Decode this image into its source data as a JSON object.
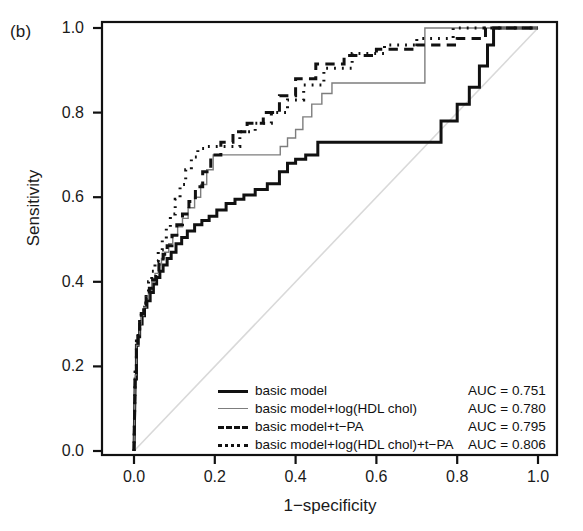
{
  "panel": {
    "label": "(b)"
  },
  "axes": {
    "xlabel": "1−specificity",
    "ylabel": "Sensitivity",
    "xticks": [
      "0.0",
      "0.2",
      "0.4",
      "0.6",
      "0.8",
      "1.0"
    ],
    "yticks": [
      "1.0",
      "0.8",
      "0.6",
      "0.4",
      "0.2",
      "0.0"
    ]
  },
  "legend": {
    "rows": [
      {
        "label": "basic model",
        "auc": "AUC = 0.751",
        "style": "solid-thick"
      },
      {
        "label": "basic model+log(HDL chol)",
        "auc": "AUC = 0.780",
        "style": "solid-thin"
      },
      {
        "label": "basic model+t−PA",
        "auc": "AUC = 0.795",
        "style": "dashed"
      },
      {
        "label": "basic model+log(HDL chol)+t−PA",
        "auc": "AUC = 0.806",
        "style": "dotted"
      }
    ]
  },
  "colors": {
    "basic_model": "#111111",
    "hdl_model": "#7d7d7d",
    "tpa_model": "#111111",
    "combined_model": "#111111",
    "diagonal": "#d9d9d9",
    "frame": "#111111",
    "background": "#ffffff"
  },
  "chart_data": {
    "type": "line",
    "title": "",
    "subtitle": "",
    "xlabel": "1−specificity",
    "ylabel": "Sensitivity",
    "xlim": [
      0.0,
      1.0
    ],
    "ylim": [
      0.0,
      1.0
    ],
    "grid": false,
    "legend_position": "bottom-right",
    "annotations": [
      {
        "text": "(b)",
        "position": "outside-top-left"
      },
      {
        "text": "AUC = 0.751",
        "series": "basic model"
      },
      {
        "text": "AUC = 0.780",
        "series": "basic model+log(HDL chol)"
      },
      {
        "text": "AUC = 0.795",
        "series": "basic model+t−PA"
      },
      {
        "text": "AUC = 0.806",
        "series": "basic model+log(HDL chol)+t−PA"
      }
    ],
    "reference_line": {
      "name": "chance diagonal",
      "x": [
        0.0,
        1.0
      ],
      "y": [
        0.0,
        1.0
      ],
      "style": "solid",
      "color": "#d9d9d9"
    },
    "series": [
      {
        "name": "basic model",
        "auc": 0.751,
        "style": "solid",
        "width": 3.0,
        "color": "#111111",
        "x": [
          0.0,
          0.003,
          0.006,
          0.006,
          0.01,
          0.01,
          0.014,
          0.014,
          0.02,
          0.02,
          0.026,
          0.026,
          0.032,
          0.032,
          0.04,
          0.04,
          0.048,
          0.048,
          0.056,
          0.056,
          0.064,
          0.064,
          0.072,
          0.072,
          0.082,
          0.082,
          0.092,
          0.092,
          0.104,
          0.104,
          0.118,
          0.118,
          0.132,
          0.132,
          0.15,
          0.15,
          0.168,
          0.168,
          0.186,
          0.186,
          0.205,
          0.205,
          0.228,
          0.228,
          0.25,
          0.25,
          0.272,
          0.272,
          0.3,
          0.3,
          0.33,
          0.33,
          0.36,
          0.36,
          0.38,
          0.38,
          0.4,
          0.4,
          0.425,
          0.425,
          0.455,
          0.455,
          0.52,
          0.52,
          0.6,
          0.6,
          0.68,
          0.68,
          0.76,
          0.76,
          0.8,
          0.8,
          0.83,
          0.83,
          0.855,
          0.855,
          0.875,
          0.875,
          0.89,
          0.89,
          1.0
        ],
        "y": [
          0.0,
          0.17,
          0.17,
          0.25,
          0.25,
          0.27,
          0.27,
          0.3,
          0.3,
          0.32,
          0.32,
          0.34,
          0.34,
          0.355,
          0.355,
          0.375,
          0.375,
          0.395,
          0.395,
          0.41,
          0.41,
          0.425,
          0.425,
          0.44,
          0.44,
          0.455,
          0.455,
          0.47,
          0.47,
          0.49,
          0.49,
          0.505,
          0.505,
          0.52,
          0.52,
          0.535,
          0.535,
          0.545,
          0.545,
          0.555,
          0.555,
          0.57,
          0.57,
          0.585,
          0.585,
          0.595,
          0.595,
          0.605,
          0.605,
          0.618,
          0.618,
          0.632,
          0.632,
          0.66,
          0.66,
          0.68,
          0.68,
          0.69,
          0.69,
          0.7,
          0.7,
          0.73,
          0.73,
          0.73,
          0.73,
          0.73,
          0.73,
          0.73,
          0.73,
          0.78,
          0.78,
          0.82,
          0.82,
          0.86,
          0.86,
          0.91,
          0.91,
          0.96,
          0.96,
          1.0,
          1.0
        ]
      },
      {
        "name": "basic model+log(HDL chol)",
        "auc": 0.78,
        "style": "solid",
        "width": 1.4,
        "color": "#7d7d7d",
        "x": [
          0.0,
          0.003,
          0.006,
          0.006,
          0.01,
          0.01,
          0.014,
          0.014,
          0.018,
          0.018,
          0.024,
          0.024,
          0.03,
          0.03,
          0.036,
          0.036,
          0.044,
          0.044,
          0.052,
          0.052,
          0.06,
          0.06,
          0.068,
          0.068,
          0.076,
          0.076,
          0.086,
          0.086,
          0.096,
          0.096,
          0.108,
          0.108,
          0.12,
          0.12,
          0.134,
          0.134,
          0.15,
          0.15,
          0.165,
          0.165,
          0.18,
          0.18,
          0.196,
          0.196,
          0.362,
          0.362,
          0.38,
          0.38,
          0.4,
          0.4,
          0.418,
          0.418,
          0.44,
          0.44,
          0.465,
          0.465,
          0.49,
          0.49,
          0.72,
          0.72,
          1.0
        ],
        "y": [
          0.0,
          0.18,
          0.18,
          0.25,
          0.25,
          0.275,
          0.275,
          0.3,
          0.3,
          0.32,
          0.32,
          0.34,
          0.34,
          0.36,
          0.36,
          0.38,
          0.38,
          0.4,
          0.4,
          0.42,
          0.42,
          0.44,
          0.44,
          0.455,
          0.455,
          0.47,
          0.47,
          0.49,
          0.49,
          0.51,
          0.51,
          0.53,
          0.53,
          0.55,
          0.55,
          0.575,
          0.575,
          0.6,
          0.6,
          0.63,
          0.63,
          0.665,
          0.665,
          0.7,
          0.7,
          0.72,
          0.72,
          0.74,
          0.74,
          0.76,
          0.76,
          0.79,
          0.79,
          0.82,
          0.82,
          0.845,
          0.845,
          0.87,
          0.87,
          1.0,
          1.0
        ]
      },
      {
        "name": "basic model+t−PA",
        "auc": 0.795,
        "style": "dashed",
        "width": 3.0,
        "color": "#111111",
        "x": [
          0.0,
          0.003,
          0.006,
          0.006,
          0.01,
          0.01,
          0.014,
          0.014,
          0.018,
          0.018,
          0.024,
          0.024,
          0.03,
          0.03,
          0.038,
          0.038,
          0.046,
          0.046,
          0.054,
          0.054,
          0.062,
          0.062,
          0.072,
          0.072,
          0.082,
          0.082,
          0.094,
          0.094,
          0.106,
          0.106,
          0.12,
          0.12,
          0.136,
          0.136,
          0.152,
          0.152,
          0.17,
          0.17,
          0.19,
          0.19,
          0.215,
          0.215,
          0.245,
          0.245,
          0.28,
          0.28,
          0.32,
          0.32,
          0.36,
          0.36,
          0.4,
          0.4,
          0.45,
          0.45,
          0.52,
          0.52,
          0.6,
          0.6,
          0.7,
          0.7,
          0.8,
          0.8,
          0.87,
          0.87,
          1.0
        ],
        "y": [
          0.0,
          0.185,
          0.185,
          0.255,
          0.255,
          0.28,
          0.28,
          0.305,
          0.305,
          0.325,
          0.325,
          0.345,
          0.345,
          0.365,
          0.365,
          0.385,
          0.385,
          0.405,
          0.405,
          0.425,
          0.425,
          0.445,
          0.445,
          0.465,
          0.465,
          0.485,
          0.485,
          0.51,
          0.51,
          0.535,
          0.535,
          0.56,
          0.56,
          0.59,
          0.59,
          0.625,
          0.625,
          0.66,
          0.66,
          0.7,
          0.7,
          0.73,
          0.73,
          0.755,
          0.755,
          0.775,
          0.775,
          0.8,
          0.8,
          0.84,
          0.84,
          0.88,
          0.88,
          0.915,
          0.915,
          0.935,
          0.935,
          0.95,
          0.95,
          0.96,
          0.96,
          0.975,
          0.975,
          1.0,
          1.0
        ]
      },
      {
        "name": "basic model+log(HDL chol)+t−PA",
        "auc": 0.806,
        "style": "dotted",
        "width": 3.0,
        "color": "#111111",
        "x": [
          0.0,
          0.003,
          0.006,
          0.006,
          0.01,
          0.01,
          0.014,
          0.014,
          0.018,
          0.018,
          0.024,
          0.024,
          0.03,
          0.03,
          0.036,
          0.036,
          0.044,
          0.044,
          0.052,
          0.052,
          0.06,
          0.06,
          0.07,
          0.07,
          0.08,
          0.08,
          0.09,
          0.09,
          0.102,
          0.102,
          0.114,
          0.114,
          0.128,
          0.128,
          0.142,
          0.142,
          0.158,
          0.158,
          0.175,
          0.175,
          0.262,
          0.262,
          0.3,
          0.3,
          0.34,
          0.34,
          0.38,
          0.38,
          0.42,
          0.42,
          0.47,
          0.47,
          0.54,
          0.54,
          0.62,
          0.62,
          0.7,
          0.7,
          0.79,
          0.79,
          1.0
        ],
        "y": [
          0.0,
          0.195,
          0.195,
          0.26,
          0.26,
          0.285,
          0.285,
          0.31,
          0.31,
          0.33,
          0.33,
          0.35,
          0.35,
          0.375,
          0.375,
          0.4,
          0.4,
          0.425,
          0.425,
          0.45,
          0.45,
          0.475,
          0.475,
          0.5,
          0.5,
          0.53,
          0.53,
          0.56,
          0.56,
          0.595,
          0.595,
          0.63,
          0.63,
          0.665,
          0.665,
          0.695,
          0.695,
          0.715,
          0.715,
          0.72,
          0.72,
          0.755,
          0.755,
          0.775,
          0.775,
          0.8,
          0.8,
          0.83,
          0.83,
          0.865,
          0.865,
          0.905,
          0.905,
          0.94,
          0.94,
          0.96,
          0.96,
          0.975,
          0.975,
          1.0,
          1.0
        ]
      }
    ]
  }
}
